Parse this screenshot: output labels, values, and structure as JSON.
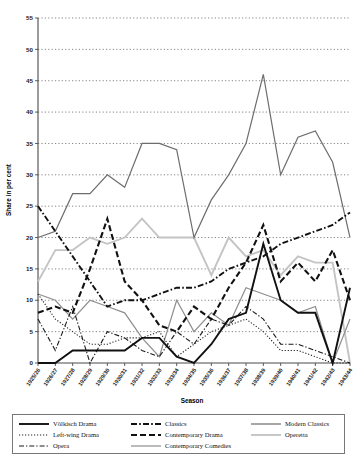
{
  "chart_data": {
    "type": "line",
    "title": "",
    "xlabel": "Season",
    "ylabel": "Share in per cent",
    "ylim": [
      0,
      55
    ],
    "ytick_step": 5,
    "grid": true,
    "legend_position": "bottom",
    "categories": [
      "1925/26",
      "1926/27",
      "1927/28",
      "1928/29",
      "1929/30",
      "1930/31",
      "1931/32",
      "1932/33",
      "1933/34",
      "1934/35",
      "1935/36",
      "1936/37",
      "1937/38",
      "1938/39",
      "1939/40",
      "1940/41",
      "1941/42",
      "1942/43",
      "1943/44"
    ],
    "yticks": [
      0,
      5,
      10,
      15,
      20,
      25,
      30,
      35,
      40,
      45,
      50,
      55
    ],
    "series": [
      {
        "name": "Völkisch Drama",
        "style": "solid-thick-black",
        "color": "#111111",
        "values": [
          0,
          0,
          2,
          2,
          2,
          2,
          4,
          4,
          1,
          0,
          3,
          7,
          8,
          19,
          10,
          8,
          8,
          0,
          12
        ]
      },
      {
        "name": "Left-wing Drama",
        "style": "dotted-black",
        "color": "#222222",
        "values": [
          11,
          7,
          5,
          3,
          3,
          4,
          4,
          5,
          1,
          3,
          5,
          6,
          7,
          5,
          2,
          2,
          1,
          0,
          0
        ]
      },
      {
        "name": "Opera",
        "style": "dash-dot-black",
        "color": "#1a1a1a",
        "values": [
          7,
          2,
          9,
          0,
          5,
          4,
          2,
          1,
          5,
          3,
          7,
          6,
          9,
          7,
          3,
          3,
          2,
          1,
          0
        ]
      },
      {
        "name": "Classics",
        "style": "dash-dot-thick-black",
        "color": "#111111",
        "values": [
          25,
          21,
          17,
          13,
          9,
          10,
          10,
          11,
          12,
          12,
          13,
          15,
          16,
          17,
          19,
          20,
          21,
          22,
          24
        ]
      },
      {
        "name": "Contemporary Drama",
        "style": "dashed-thick-black",
        "color": "#111111",
        "values": [
          8,
          9,
          8,
          15,
          23,
          13,
          10,
          6,
          5,
          9,
          7,
          12,
          16,
          22,
          13,
          16,
          13,
          18,
          10
        ]
      },
      {
        "name": "Contemporary Comedies",
        "style": "solid-midgray",
        "color": "#8e8e8e",
        "values": [
          11,
          10,
          7,
          10,
          9,
          8,
          4,
          1,
          10,
          5,
          8,
          6,
          12,
          11,
          10,
          8,
          9,
          0,
          7
        ]
      },
      {
        "name": "Modern Classics",
        "style": "solid-darkgray",
        "color": "#6d6d6d",
        "values": [
          20,
          21,
          27,
          27,
          30,
          28,
          35,
          35,
          34,
          20,
          26,
          30,
          35,
          46,
          30,
          36,
          37,
          32,
          20
        ]
      },
      {
        "name": "Operetta",
        "style": "solid-lightgray",
        "color": "#c4c4c4",
        "values": [
          13,
          18,
          18,
          20,
          19,
          20,
          23,
          20,
          20,
          20,
          14,
          20,
          17,
          18,
          14,
          17,
          16,
          16,
          0
        ]
      }
    ]
  },
  "axis": {
    "x_title": "Season",
    "y_title": "Share in per cent"
  },
  "legend": {
    "entries": [
      {
        "label": "Völkisch Drama",
        "style": "solid-thick-black",
        "color": "#111111"
      },
      {
        "label": "Classics",
        "style": "dash-dot-thick-black",
        "color": "#111111"
      },
      {
        "label": "Modern Classics",
        "style": "solid-darkgray",
        "color": "#6d6d6d"
      },
      {
        "label": "Left-wing Drama",
        "style": "dotted-black",
        "color": "#222222"
      },
      {
        "label": "Contemporary Drama",
        "style": "dashed-thick-black",
        "color": "#111111"
      },
      {
        "label": "Operetta",
        "style": "solid-lightgray",
        "color": "#c4c4c4"
      },
      {
        "label": "Opera",
        "style": "dash-dot-black",
        "color": "#1a1a1a"
      },
      {
        "label": "Contemporary Comedies",
        "style": "solid-midgray",
        "color": "#8e8e8e"
      },
      {
        "label": "",
        "style": "none",
        "color": "#ffffff"
      }
    ]
  }
}
